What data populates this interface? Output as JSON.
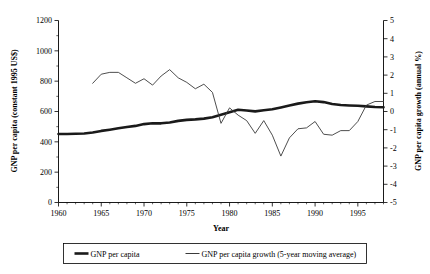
{
  "chart_data": {
    "type": "line",
    "title": "",
    "xlabel": "Year",
    "ylabel": "GNP per capita (constant 1995 US$)",
    "y2label": "GNP per capita growth (annual %)",
    "xlim": [
      1960,
      1998
    ],
    "ylim": [
      0,
      1200
    ],
    "y2lim": [
      -5,
      5
    ],
    "grid": false,
    "legend_position": "bottom-center",
    "xticks": [
      1960,
      1965,
      1970,
      1975,
      1980,
      1985,
      1990,
      1995
    ],
    "xticklabels": [
      "1960",
      "1965",
      "1970",
      "1975",
      "1980",
      "1985",
      "1990",
      "1995"
    ],
    "yticks": [
      0,
      200,
      400,
      600,
      800,
      1000,
      1200
    ],
    "yticklabels": [
      "0",
      "200",
      "400",
      "600",
      "800",
      "1000",
      "1200"
    ],
    "y2ticks": [
      -5,
      -4,
      -3,
      -2,
      -1,
      0,
      1,
      2,
      3,
      4,
      5
    ],
    "y2ticklabels": [
      "-5",
      "-4",
      "-3",
      "-2",
      "-1",
      "0",
      "1",
      "2",
      "3",
      "4",
      "5"
    ],
    "series": [
      {
        "name": "GNP per capita",
        "axis": "left",
        "style": "thick",
        "x": [
          1960,
          1961,
          1962,
          1963,
          1964,
          1965,
          1966,
          1967,
          1968,
          1969,
          1970,
          1971,
          1972,
          1973,
          1974,
          1975,
          1976,
          1977,
          1978,
          1979,
          1980,
          1981,
          1982,
          1983,
          1984,
          1985,
          1986,
          1987,
          1988,
          1989,
          1990,
          1991,
          1992,
          1993,
          1994,
          1995,
          1996,
          1997,
          1998
        ],
        "y": [
          452,
          452,
          453,
          455,
          462,
          472,
          480,
          489,
          498,
          505,
          517,
          522,
          522,
          528,
          538,
          545,
          548,
          553,
          562,
          578,
          595,
          612,
          607,
          601,
          608,
          615,
          627,
          640,
          652,
          661,
          668,
          662,
          650,
          643,
          640,
          638,
          634,
          630,
          628
        ]
      },
      {
        "name": "GNP per capita growth (5-year moving average)",
        "axis": "right",
        "style": "thin",
        "x": [
          1964,
          1965,
          1966,
          1967,
          1968,
          1969,
          1970,
          1971,
          1972,
          1973,
          1974,
          1975,
          1976,
          1977,
          1978,
          1979,
          1980,
          1981,
          1982,
          1983,
          1984,
          1985,
          1986,
          1987,
          1988,
          1989,
          1990,
          1991,
          1992,
          1993,
          1994,
          1995,
          1996,
          1997,
          1998
        ],
        "y": [
          1.55,
          2.05,
          2.15,
          2.15,
          1.85,
          1.55,
          1.8,
          1.45,
          1.95,
          2.3,
          1.85,
          1.6,
          1.25,
          1.5,
          1.05,
          -0.65,
          0.2,
          -0.2,
          -0.5,
          -1.2,
          -0.5,
          -1.3,
          -2.45,
          -1.45,
          -0.95,
          -0.9,
          -0.55,
          -1.25,
          -1.3,
          -1.05,
          -1.05,
          -0.55,
          0.35,
          0.55,
          0.55
        ]
      }
    ],
    "legend": [
      {
        "label": "GNP per capita",
        "style": "thick"
      },
      {
        "label": "GNP per capita growth (5-year moving average)",
        "style": "thin"
      }
    ],
    "colors": {
      "thick": "#1a1a1a",
      "thin": "#3a3a3a",
      "axis": "#000000",
      "background": "#ffffff"
    }
  }
}
